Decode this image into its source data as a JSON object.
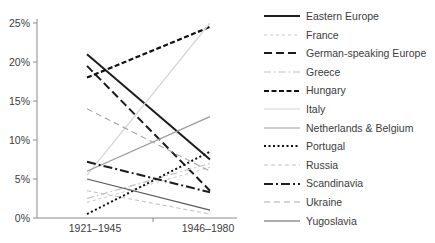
{
  "chart_data": {
    "type": "line",
    "subtype": "slopegraph",
    "title": "",
    "xlabel": "",
    "ylabel": "",
    "categories": [
      "1921–1945",
      "1946–1980"
    ],
    "y_ticks": [
      "0%",
      "5%",
      "10%",
      "15%",
      "20%",
      "25%"
    ],
    "ylim": [
      0,
      25
    ],
    "grid": false,
    "legend_position": "right",
    "axis_color": "#8a8a8a",
    "series": [
      {
        "name": "Eastern Europe",
        "slug": "eastern-europe",
        "values": [
          21.0,
          7.5
        ],
        "color": "#1c1c1c",
        "width": 2,
        "dash": ""
      },
      {
        "name": "France",
        "slug": "france",
        "values": [
          2.0,
          6.5
        ],
        "color": "#c9c9c9",
        "width": 1,
        "dash": "3,3"
      },
      {
        "name": "German-speaking Europe",
        "slug": "german-speaking-europe",
        "values": [
          19.5,
          3.5
        ],
        "color": "#1c1c1c",
        "width": 2,
        "dash": "8,4"
      },
      {
        "name": "Greece",
        "slug": "greece",
        "values": [
          2.5,
          7.0
        ],
        "color": "#c2c2c2",
        "width": 1.2,
        "dash": "7,3,1.5,3"
      },
      {
        "name": "Hungary",
        "slug": "hungary",
        "values": [
          18.0,
          24.5
        ],
        "color": "#111111",
        "width": 2.2,
        "dash": "5,2.5"
      },
      {
        "name": "Italy",
        "slug": "italy",
        "values": [
          5.5,
          25.0
        ],
        "color": "#d6d6d6",
        "width": 1.2,
        "dash": ""
      },
      {
        "name": "Netherlands & Belgium",
        "slug": "netherlands-belgium",
        "values": [
          6.0,
          13.0
        ],
        "color": "#9b9b9b",
        "width": 1.2,
        "dash": ""
      },
      {
        "name": "Portugal",
        "slug": "portugal",
        "values": [
          0.5,
          8.5
        ],
        "color": "#111111",
        "width": 2,
        "dash": "2,2.5"
      },
      {
        "name": "Russia",
        "slug": "russia",
        "values": [
          3.5,
          0.5
        ],
        "color": "#c0c0c0",
        "width": 1,
        "dash": "4,3"
      },
      {
        "name": "Scandinavia",
        "slug": "scandinavia",
        "values": [
          7.2,
          3.3
        ],
        "color": "#1c1c1c",
        "width": 2,
        "dash": "9,3,2,3"
      },
      {
        "name": "Ukraine",
        "slug": "ukraine",
        "values": [
          14.0,
          6.0
        ],
        "color": "#ababab",
        "width": 1.2,
        "dash": "6,4"
      },
      {
        "name": "Yugoslavia",
        "slug": "yugoslavia",
        "values": [
          5.0,
          1.0
        ],
        "color": "#5a5a5a",
        "width": 1.2,
        "dash": ""
      }
    ]
  }
}
